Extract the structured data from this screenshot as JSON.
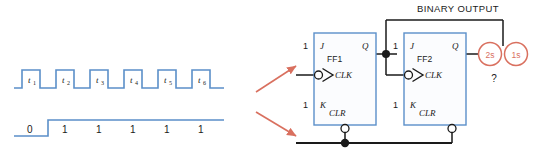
{
  "diagram": {
    "colors": {
      "waveform": "#5b8fc9",
      "block_outline": "#5b8fc9",
      "block_fill": "#fbfcfe",
      "wire": "#1a1a1a",
      "accent_orange": "#d9705f",
      "arrow": "#d9705f",
      "text": "#1a1a1a"
    }
  },
  "clock_waveform": {
    "name": "clock-pulse-train",
    "pulse_labels": [
      "t",
      "t",
      "t",
      "t",
      "t",
      "t"
    ],
    "pulse_subscripts": [
      "1",
      "2",
      "3",
      "4",
      "5",
      "6"
    ],
    "pulse_count": 6,
    "level_high": "high",
    "level_low": "low"
  },
  "data_waveform": {
    "name": "logic-level-train",
    "values": [
      "0",
      "1",
      "1",
      "1",
      "1",
      "1",
      "1"
    ],
    "initial_value": "0",
    "held_value": "1"
  },
  "flipflops": [
    {
      "id": "ff1",
      "name": "FF1",
      "j_label": "J",
      "j_value": "1",
      "k_label": "K",
      "k_value": "1",
      "clk_label": "CLK",
      "clr_label": "CLR",
      "q_label": "Q"
    },
    {
      "id": "ff2",
      "name": "FF2",
      "j_label": "J",
      "j_value": "1",
      "k_label": "K",
      "k_value": "1",
      "clk_label": "CLK",
      "clr_label": "CLR",
      "q_label": "Q"
    }
  ],
  "output": {
    "heading": "BINARY OUTPUT",
    "weights": [
      {
        "id": "twos",
        "label": "2s"
      },
      {
        "id": "ones",
        "label": "1s"
      }
    ],
    "unknown_marker": "?"
  },
  "annotations": {
    "clock_arrow": "arrow-to-clk-input",
    "clear_arrow": "arrow-to-clr-line"
  }
}
